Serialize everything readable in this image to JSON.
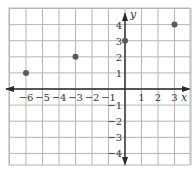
{
  "chart_data": {
    "type": "scatter",
    "title": "",
    "xlabel": "x",
    "ylabel": "y",
    "xlim": [
      -7,
      4
    ],
    "ylim": [
      -5,
      5
    ],
    "grid": true,
    "x_ticks": [
      -6,
      -5,
      -4,
      -3,
      -2,
      -1,
      1,
      2,
      3
    ],
    "y_ticks": [
      4,
      3,
      2,
      1,
      -1,
      -2,
      -3,
      -4
    ],
    "x_tick_labels": [
      "−6",
      "−5",
      "−4",
      "−3",
      "−2",
      "−1",
      "1",
      "2",
      "3"
    ],
    "y_tick_labels": [
      "4",
      "3",
      "2",
      "1",
      "−1",
      "−2",
      "−3",
      "−4"
    ],
    "series": [
      {
        "name": "points",
        "points": [
          {
            "x": -6,
            "y": 1
          },
          {
            "x": -3,
            "y": 2
          },
          {
            "x": 0,
            "y": 3
          },
          {
            "x": 3,
            "y": 4
          }
        ]
      }
    ]
  },
  "style": {
    "grid_color": "#b5b5b5",
    "axis_color": "#2a2a2a",
    "point_color": "#5a5a5a"
  }
}
